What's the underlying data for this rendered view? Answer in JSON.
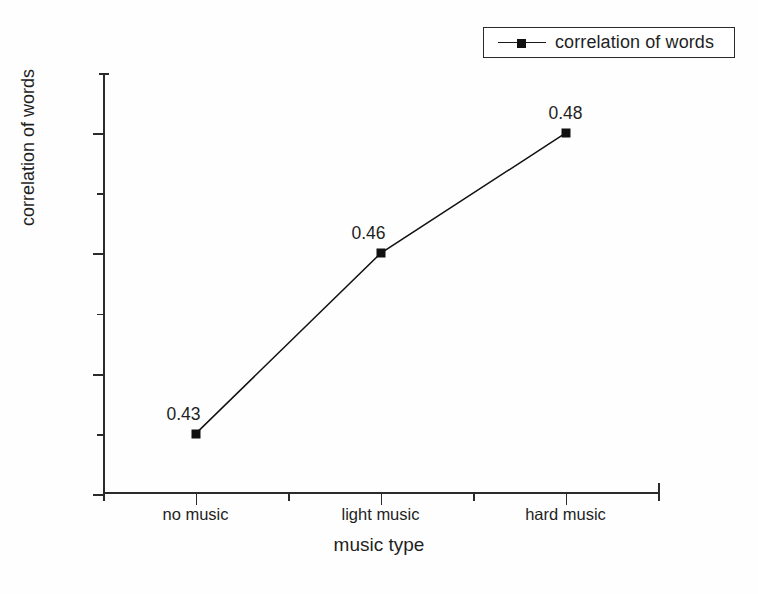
{
  "chart_data": {
    "type": "line",
    "title": "",
    "categories": [
      "no music",
      "light music",
      "hard music"
    ],
    "values": [
      0.43,
      0.46,
      0.48
    ],
    "point_labels": [
      "0.43",
      "0.46",
      "0.48"
    ],
    "series": [
      {
        "name": "correlation of words",
        "values": [
          0.43,
          0.46,
          0.48
        ]
      }
    ],
    "xlabel": "music type",
    "ylabel": "correlation of words",
    "ylim": [
      0.42,
      0.49
    ],
    "ytick_labels": [
      "0.42",
      "0.44",
      "0.46",
      "0.48"
    ],
    "ytick_values": [
      0.42,
      0.44,
      0.46,
      0.48
    ],
    "yminor_values": [
      0.43,
      0.45,
      0.47
    ],
    "grid": false,
    "legend": {
      "position": "top-right",
      "entries": [
        "correlation of words"
      ],
      "marker": "filled-square",
      "line": "solid"
    },
    "colors": {
      "line": "#111111",
      "marker": "#111111",
      "axis": "#2b2b2b",
      "text": "#1f1f1f",
      "background": "#fefefe"
    }
  },
  "legend": {
    "label": "correlation of words"
  },
  "axes": {
    "x_title": "music type",
    "y_title": "correlation of words"
  }
}
